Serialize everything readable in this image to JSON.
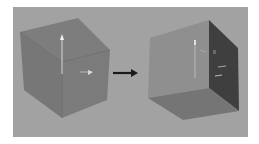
{
  "figure": {
    "background": "#ffffff",
    "panel_color": "#a2a2a2",
    "before": {
      "label": "cube-before-rotation",
      "faces": {
        "top": "#7c7c7c",
        "front": "#7a7a7a",
        "side": "#787878"
      },
      "edge_color": "#6a6a6a"
    },
    "after": {
      "label": "cube-after-rotation",
      "faces": {
        "front": "#8e8e8e",
        "right": "#3e3e3e",
        "bottom": "#747474"
      }
    },
    "arrow": {
      "color": "#1a1a1a",
      "direction": "right"
    },
    "manipulator_color": "#e8e8e8"
  }
}
